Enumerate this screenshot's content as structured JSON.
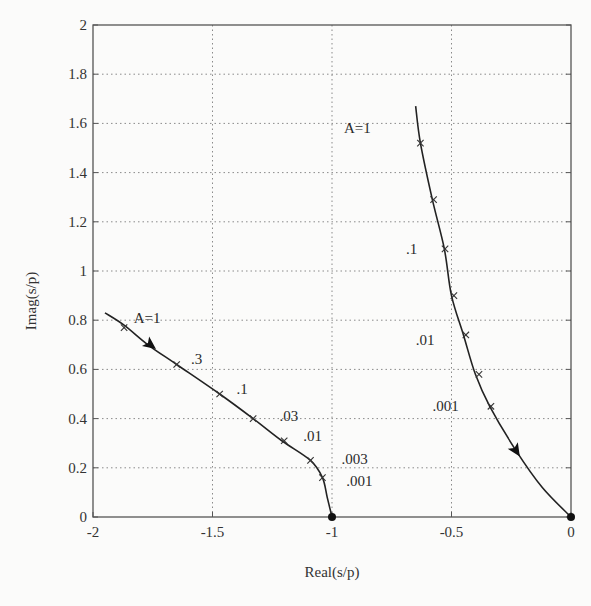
{
  "chart_data": {
    "type": "line",
    "title": "",
    "xlabel": "Real(s/p)",
    "ylabel": "Imag(s/p)",
    "xlim": [
      -2,
      0
    ],
    "ylim": [
      0,
      2
    ],
    "grid": true,
    "x_ticks": [
      -2,
      -1.5,
      -1,
      -0.5,
      0
    ],
    "x_tick_labels": [
      "-2",
      "-1.5",
      "-1",
      "-0.5",
      "0"
    ],
    "y_ticks": [
      0,
      0.2,
      0.4,
      0.6,
      0.8,
      1,
      1.2,
      1.4,
      1.6,
      1.8,
      2
    ],
    "y_tick_labels": [
      "0",
      "0.2",
      "0.4",
      "0.6",
      "0.8",
      "1",
      "1.2",
      "1.4",
      "1.6",
      "1.8",
      "2"
    ],
    "series": [
      {
        "name": "locus-left",
        "x": [
          -1.95,
          -1.87,
          -1.77,
          -1.65,
          -1.47,
          -1.33,
          -1.21,
          -1.09,
          -1.04,
          -1.02,
          -1.0
        ],
        "y": [
          0.83,
          0.78,
          0.7,
          0.62,
          0.5,
          0.4,
          0.31,
          0.23,
          0.16,
          0.08,
          0.0
        ],
        "markers": [
          {
            "x": -1.87,
            "y": 0.77
          },
          {
            "x": -1.65,
            "y": 0.62
          },
          {
            "x": -1.47,
            "y": 0.5
          },
          {
            "x": -1.33,
            "y": 0.4
          },
          {
            "x": -1.2,
            "y": 0.31
          },
          {
            "x": -1.09,
            "y": 0.23
          },
          {
            "x": -1.04,
            "y": 0.16
          }
        ],
        "arrow": {
          "x": -1.76,
          "y": 0.7,
          "direction": "down-right"
        },
        "endpoint": {
          "x": -1.0,
          "y": 0.0
        }
      },
      {
        "name": "locus-right",
        "x": [
          -0.65,
          -0.63,
          -0.58,
          -0.53,
          -0.5,
          -0.45,
          -0.4,
          -0.34,
          -0.23,
          -0.12,
          0.0
        ],
        "y": [
          1.67,
          1.52,
          1.29,
          1.09,
          0.9,
          0.74,
          0.58,
          0.45,
          0.27,
          0.12,
          0.0
        ],
        "markers": [
          {
            "x": -0.63,
            "y": 1.52
          },
          {
            "x": -0.575,
            "y": 1.29
          },
          {
            "x": -0.527,
            "y": 1.09
          },
          {
            "x": -0.49,
            "y": 0.9
          },
          {
            "x": -0.44,
            "y": 0.74
          },
          {
            "x": -0.385,
            "y": 0.58
          },
          {
            "x": -0.335,
            "y": 0.45
          }
        ],
        "arrow": {
          "x": -0.23,
          "y": 0.27,
          "direction": "down-right"
        },
        "endpoint": {
          "x": 0.0,
          "y": 0.0
        }
      }
    ],
    "annotations": [
      {
        "text": "A=1",
        "x": -1.83,
        "y": 0.79
      },
      {
        "text": ".3",
        "x": -1.59,
        "y": 0.62
      },
      {
        "text": ".1",
        "x": -1.4,
        "y": 0.5
      },
      {
        "text": ".03",
        "x": -1.22,
        "y": 0.39
      },
      {
        "text": ".01",
        "x": -1.12,
        "y": 0.31
      },
      {
        "text": ".003",
        "x": -0.96,
        "y": 0.215
      },
      {
        "text": ".001",
        "x": -0.94,
        "y": 0.125
      },
      {
        "text": "A=1",
        "x": -0.95,
        "y": 1.56
      },
      {
        "text": ".1",
        "x": -0.69,
        "y": 1.07
      },
      {
        "text": ".01",
        "x": -0.65,
        "y": 0.7
      },
      {
        "text": ".001",
        "x": -0.58,
        "y": 0.43
      }
    ]
  }
}
